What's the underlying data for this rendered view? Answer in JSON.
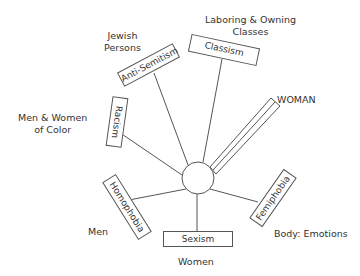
{
  "diagram": {
    "type": "hub-and-spoke",
    "hub": {
      "shape": "circle"
    },
    "spokes": [
      {
        "box": "Anti-Semitism",
        "group": "Jewish Persons"
      },
      {
        "box": "Classism",
        "group": "Laboring & Owning Classes"
      },
      {
        "box": "",
        "group": "WOMAN",
        "style": "double-bar"
      },
      {
        "box": "Racism",
        "group": "Men & Women of Color"
      },
      {
        "box": "Homophobia",
        "group": "Men"
      },
      {
        "box": "Sexism",
        "group": "Women"
      },
      {
        "box": "Femiphobia",
        "group": "Body: Emotions"
      }
    ]
  },
  "labels": {
    "jewish_line1": "Jewish",
    "jewish_line2": "Persons",
    "classes_line1": "Laboring & Owning",
    "classes_line2": "Classes",
    "woman": "WOMAN",
    "color_line1": "Men & Women",
    "color_line2": "of Color",
    "men": "Men",
    "women": "Women",
    "body_emotions": "Body: Emotions"
  },
  "boxes": {
    "anti_semitism": "Anti-Semitism",
    "classism": "Classism",
    "racism": "Racism",
    "homophobia": "Homophobia",
    "sexism": "Sexism",
    "femiphobia": "Femiphobia"
  },
  "colors": {
    "stroke": "#555555",
    "text": "#333333",
    "background": "#ffffff"
  }
}
